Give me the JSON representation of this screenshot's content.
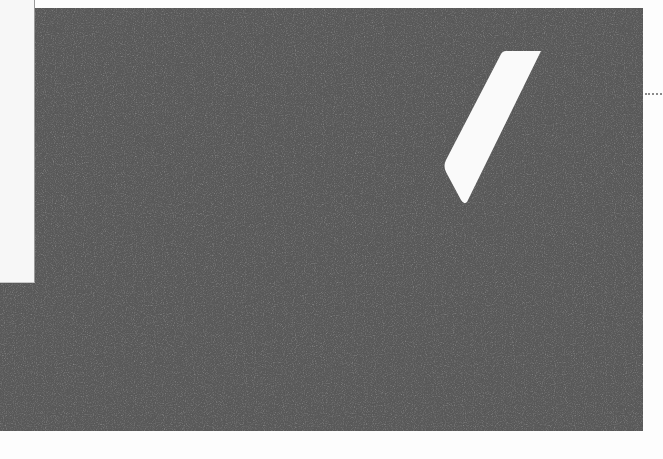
{
  "scene": {
    "description": "Scanned dark grey textured sheet with a white slanted parallelogram shape",
    "colors": {
      "background": "#fdfdfd",
      "sheet": "#5a5a5a",
      "sheet_noise_light": "#6e6e6e",
      "sheet_noise_dark": "#4a4a4a",
      "shape": "#fafafa",
      "panel": "#f7f7f7"
    },
    "sheet_bounds": {
      "x": 0,
      "y": 8,
      "right": 643,
      "bottom": 431
    },
    "left_panel": {
      "x": 0,
      "y": 0,
      "width": 34,
      "height": 282
    },
    "white_shape": {
      "type": "parallelogram",
      "points": [
        [
          503,
          51
        ],
        [
          541,
          51
        ],
        [
          465,
          203
        ],
        [
          444,
          165
        ]
      ]
    },
    "dotted_mark": {
      "x1": 645,
      "x2": 662,
      "y": 94
    }
  }
}
